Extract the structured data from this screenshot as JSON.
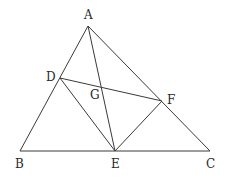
{
  "diagram": {
    "type": "geometry-figure",
    "stroke_color": "#3a3a3a",
    "label_color": "#2a2a2a",
    "points": {
      "A": {
        "x": 88,
        "y": 26,
        "label": "A",
        "lx": 84,
        "ly": 19
      },
      "B": {
        "x": 20,
        "y": 151,
        "label": "B",
        "lx": 15,
        "ly": 168
      },
      "C": {
        "x": 210,
        "y": 151,
        "label": "C",
        "lx": 206,
        "ly": 168
      },
      "D": {
        "x": 60,
        "y": 78,
        "label": "D",
        "lx": 46,
        "ly": 81
      },
      "E": {
        "x": 115,
        "y": 151,
        "label": "E",
        "lx": 111,
        "ly": 168
      },
      "F": {
        "x": 162,
        "y": 101,
        "label": "F",
        "lx": 167,
        "ly": 104
      },
      "G": {
        "x": 101,
        "y": 87,
        "label": "G",
        "lx": 90,
        "ly": 99
      }
    },
    "segments": [
      {
        "name": "segment-ab",
        "from": "A",
        "to": "B"
      },
      {
        "name": "segment-ac",
        "from": "A",
        "to": "C"
      },
      {
        "name": "segment-bc",
        "from": "B",
        "to": "C"
      },
      {
        "name": "segment-ae",
        "from": "A",
        "to": "E"
      },
      {
        "name": "segment-df",
        "from": "D",
        "to": "F"
      },
      {
        "name": "segment-de",
        "from": "D",
        "to": "E"
      },
      {
        "name": "segment-ef",
        "from": "E",
        "to": "F"
      }
    ]
  }
}
